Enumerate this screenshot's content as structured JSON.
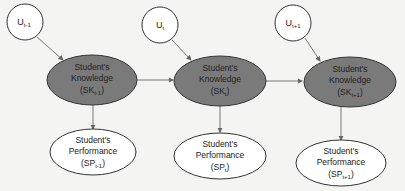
{
  "diagram": {
    "colors": {
      "background": "#f4f4f2",
      "knowledge_fill": "#7a7a7a",
      "performance_fill": "#ffffff",
      "unobserved_fill": "#ffffff",
      "stroke": "#333333",
      "edge": "#666666"
    },
    "nodes": {
      "u_prev": {
        "main": "U",
        "sub": "t-1"
      },
      "u_curr": {
        "main": "U",
        "sub": "t"
      },
      "u_next": {
        "main": "U",
        "sub": "t+1"
      },
      "sk_prev": {
        "line1": "Student's",
        "line2": "Knowledge",
        "main": "(SK",
        "sub": "t-1",
        "close": ")"
      },
      "sk_curr": {
        "line1": "Student's",
        "line2": "Knowledge",
        "main": "(SK",
        "sub": "t",
        "close": ")"
      },
      "sk_next": {
        "line1": "Student's",
        "line2": "Knowledge",
        "main": "(SK",
        "sub": "t+1",
        "close": ")"
      },
      "sp_prev": {
        "line1": "Student's",
        "line2": "Performance",
        "main": "(SP",
        "sub": "t-1",
        "close": ")"
      },
      "sp_curr": {
        "line1": "Student's",
        "line2": "Performance",
        "main": "(SP",
        "sub": "t",
        "close": ")"
      },
      "sp_next": {
        "line1": "Student's",
        "line2": "Performance",
        "main": "(SP",
        "sub": "t+1",
        "close": ")"
      }
    },
    "edges": [
      {
        "from": "u_prev",
        "to": "sk_prev"
      },
      {
        "from": "u_curr",
        "to": "sk_curr"
      },
      {
        "from": "u_next",
        "to": "sk_next"
      },
      {
        "from": "sk_prev",
        "to": "sk_curr"
      },
      {
        "from": "sk_curr",
        "to": "sk_next"
      },
      {
        "from": "sk_prev",
        "to": "sp_prev"
      },
      {
        "from": "sk_curr",
        "to": "sp_curr"
      },
      {
        "from": "sk_next",
        "to": "sp_next"
      }
    ]
  }
}
